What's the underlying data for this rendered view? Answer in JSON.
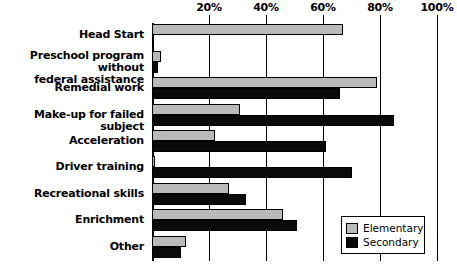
{
  "chart_data": {
    "type": "bar",
    "orientation": "horizontal",
    "title": "",
    "subtitle": "",
    "xlabel": "",
    "ylabel": "",
    "xlim": [
      0,
      100
    ],
    "xticks": [
      0,
      20,
      40,
      60,
      80,
      100
    ],
    "xtick_labels": [
      "",
      "20%",
      "40%",
      "60%",
      "80%",
      "100%"
    ],
    "grid": true,
    "grid_axis": "x",
    "legend_position": "bottom-right",
    "categories": [
      "Head Start",
      "Preschool program without federal assistance",
      "Remedial work",
      "Make-up for failed subject",
      "Acceleration",
      "Driver training",
      "Recreational skills",
      "Enrichment",
      "Other"
    ],
    "category_label_lines": [
      [
        "Head Start"
      ],
      [
        "Preschool program without",
        "federal assistance"
      ],
      [
        "Remedial work"
      ],
      [
        "Make-up for failed subject"
      ],
      [
        "Acceleration"
      ],
      [
        "Driver training"
      ],
      [
        "Recreational skills"
      ],
      [
        "Enrichment"
      ],
      [
        "Other"
      ]
    ],
    "series": [
      {
        "name": "Elementary",
        "color": "#b9b9b9",
        "values": [
          67,
          3,
          79,
          31,
          22,
          1,
          27,
          46,
          12
        ]
      },
      {
        "name": "Secondary",
        "color": "#0a0a0a",
        "values": [
          0,
          2,
          66,
          85,
          61,
          70,
          33,
          51,
          10
        ]
      }
    ]
  },
  "legend": {
    "items": [
      {
        "label": "Elementary",
        "swatch": "elementary"
      },
      {
        "label": "Secondary",
        "swatch": "secondary"
      }
    ]
  },
  "axis": {
    "ticks": [
      {
        "value": 0,
        "label": ""
      },
      {
        "value": 20,
        "label": "20%"
      },
      {
        "value": 40,
        "label": "40%"
      },
      {
        "value": 60,
        "label": "60%"
      },
      {
        "value": 80,
        "label": "80%"
      },
      {
        "value": 100,
        "label": "100%"
      }
    ]
  },
  "colors": {
    "elementary": "#b9b9b9",
    "secondary": "#0a0a0a",
    "axis": "#000000",
    "background": "#ffffff"
  }
}
